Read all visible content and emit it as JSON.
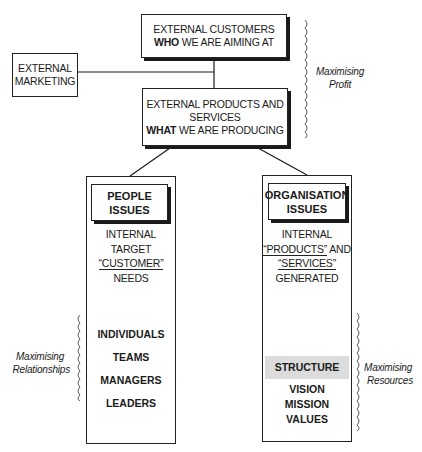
{
  "diagram": {
    "top_box": {
      "line1": "EXTERNAL CUSTOMERS",
      "line2_bold": "WHO",
      "line2_rest": " WE ARE AIMING AT"
    },
    "marketing_box": {
      "line1": "EXTERNAL",
      "line2": "MARKETING"
    },
    "middle_box": {
      "line1": "EXTERNAL PRODUCTS AND",
      "line2": "SERVICES",
      "line3_bold": "WHAT",
      "line3_rest": " WE ARE PRODUCING"
    },
    "left_column": {
      "header_line1": "PEOPLE",
      "header_line2": "ISSUES",
      "desc": [
        "INTERNAL",
        "TARGET",
        "“CUSTOMER”",
        "NEEDS"
      ],
      "items": [
        "INDIVIDUALS",
        "TEAMS",
        "MANAGERS",
        "LEADERS"
      ]
    },
    "right_column": {
      "header_line1": "ORGANISATION",
      "header_line2": "ISSUES",
      "desc": [
        "INTERNAL",
        "“PRODUCTS”",
        " AND",
        "“SERVICES”",
        "GENERATED"
      ],
      "highlight_item": "STRUCTURE",
      "items": [
        "VISION",
        "MISSION",
        "VALUES"
      ]
    },
    "braces": {
      "profit": {
        "line1": "Maximising",
        "line2": "Profit"
      },
      "relationships": {
        "line1": "Maximising",
        "line2": "Relationships"
      },
      "resources": {
        "line1": "Maximising",
        "line2": "Resources"
      }
    },
    "colors": {
      "line": "#1a1a1a",
      "highlight": "#dcdcdc",
      "background": "#ffffff"
    }
  }
}
